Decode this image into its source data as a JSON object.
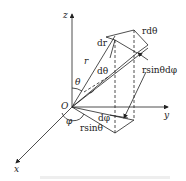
{
  "diagram": {
    "axes": {
      "z": "z",
      "y": "y",
      "x": "x",
      "origin": "O"
    },
    "labels": {
      "dr": "dr",
      "r_dtheta": "rdθ",
      "r": "r",
      "dtheta": "dθ",
      "theta": "θ",
      "r_sin_theta_dphi": "rsinθdφ",
      "dphi": "dφ",
      "phi": "φ",
      "r_sin_theta": "rsinθ"
    },
    "colors": {
      "line": "#222222",
      "caption": "#cccccc"
    }
  }
}
